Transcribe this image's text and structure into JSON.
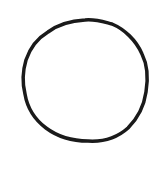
{
  "drawing": {
    "shape": "circle",
    "style": "hand-drawn",
    "stroke_color": "#1a1a1a",
    "fill_color": "none",
    "background": "#ffffff"
  }
}
